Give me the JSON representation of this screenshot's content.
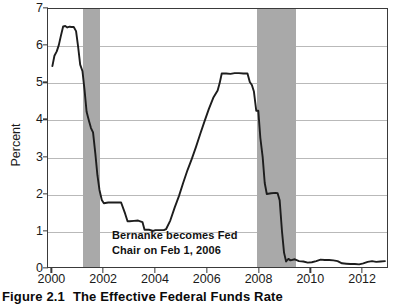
{
  "caption": {
    "number": "Figure 2.1",
    "title": "The Effective Federal Funds Rate"
  },
  "annotation": {
    "text": "Bernanke becomes Fed\nChair on Feb 1, 2006"
  },
  "colors": {
    "line": "#1d1d1d",
    "recession_band": "#a9a9a9",
    "gridline": "#b9b9b9",
    "axis": "#3a3a3a",
    "background": "#ffffff"
  },
  "chart_data": {
    "type": "line",
    "title": "The Effective Federal Funds Rate",
    "xlabel": "",
    "ylabel": "Percent",
    "xlim": [
      1999.83,
      2013.0
    ],
    "ylim": [
      0,
      7
    ],
    "yticks": [
      0,
      1,
      2,
      3,
      4,
      5,
      6,
      7
    ],
    "ytick_labels": [
      "0",
      "1",
      "2",
      "3",
      "4",
      "5",
      "6",
      "7"
    ],
    "xticks": [
      2000,
      2002,
      2004,
      2006,
      2008,
      2010,
      2012
    ],
    "xtick_labels": [
      "2000",
      "2002",
      "2004",
      "2006",
      "2008",
      "2010",
      "2012"
    ],
    "grid": true,
    "grid_axis": "y",
    "legend": null,
    "series": [
      {
        "name": "Effective Federal Funds Rate",
        "x": [
          2000.0,
          2000.08,
          2000.17,
          2000.25,
          2000.33,
          2000.42,
          2000.5,
          2000.58,
          2000.67,
          2000.75,
          2000.83,
          2000.92,
          2001.0,
          2001.08,
          2001.17,
          2001.25,
          2001.33,
          2001.42,
          2001.5,
          2001.58,
          2001.67,
          2001.75,
          2001.83,
          2001.92,
          2002.0,
          2002.17,
          2002.42,
          2002.67,
          2002.83,
          2002.92,
          2003.0,
          2003.17,
          2003.33,
          2003.5,
          2003.58,
          2003.75,
          2003.92,
          2004.0,
          2004.17,
          2004.33,
          2004.42,
          2004.58,
          2004.75,
          2004.92,
          2005.08,
          2005.25,
          2005.42,
          2005.58,
          2005.75,
          2005.92,
          2006.08,
          2006.25,
          2006.42,
          2006.5,
          2006.58,
          2006.75,
          2006.92,
          2007.08,
          2007.25,
          2007.42,
          2007.58,
          2007.67,
          2007.75,
          2007.83,
          2007.92,
          2008.0,
          2008.08,
          2008.17,
          2008.25,
          2008.33,
          2008.5,
          2008.67,
          2008.75,
          2008.83,
          2008.92,
          2009.0,
          2009.08,
          2009.17,
          2009.25,
          2009.42,
          2009.58,
          2009.75,
          2009.92,
          2010.08,
          2010.25,
          2010.42,
          2010.58,
          2010.75,
          2010.92,
          2011.08,
          2011.25,
          2011.42,
          2011.58,
          2011.75,
          2011.92,
          2012.08,
          2012.25,
          2012.42,
          2012.58,
          2012.75,
          2012.92
        ],
        "y": [
          5.45,
          5.73,
          5.85,
          6.02,
          6.27,
          6.53,
          6.54,
          6.5,
          6.52,
          6.51,
          6.51,
          6.4,
          5.98,
          5.49,
          5.31,
          4.8,
          4.21,
          3.97,
          3.77,
          3.65,
          3.07,
          2.49,
          2.09,
          1.82,
          1.73,
          1.75,
          1.75,
          1.75,
          1.44,
          1.24,
          1.24,
          1.25,
          1.26,
          1.22,
          1.01,
          1.01,
          0.98,
          1.0,
          1.0,
          1.0,
          1.03,
          1.26,
          1.61,
          1.93,
          2.28,
          2.63,
          2.94,
          3.26,
          3.62,
          3.97,
          4.29,
          4.59,
          4.79,
          4.99,
          5.25,
          5.25,
          5.24,
          5.26,
          5.26,
          5.25,
          5.25,
          5.02,
          4.94,
          4.76,
          4.24,
          4.24,
          3.5,
          2.98,
          2.28,
          1.98,
          2.0,
          2.01,
          2.0,
          1.81,
          0.97,
          0.39,
          0.15,
          0.22,
          0.18,
          0.21,
          0.16,
          0.15,
          0.12,
          0.13,
          0.16,
          0.2,
          0.19,
          0.19,
          0.18,
          0.16,
          0.1,
          0.09,
          0.08,
          0.08,
          0.07,
          0.1,
          0.14,
          0.16,
          0.14,
          0.15,
          0.16
        ]
      }
    ],
    "recession_bands": [
      {
        "start": 2001.17,
        "end": 2001.83,
        "label": "2001 recession"
      },
      {
        "start": 2007.92,
        "end": 2009.42,
        "label": "Great Recession"
      }
    ],
    "annotations": [
      {
        "text": "Bernanke becomes Fed Chair on Feb 1, 2006",
        "x": 2004.1,
        "y": 0.75
      }
    ]
  }
}
